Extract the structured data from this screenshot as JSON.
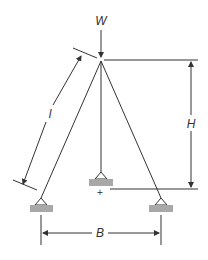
{
  "diagram": {
    "type": "structural-tripod-frame",
    "labels": {
      "load": "W",
      "leg_length": "l",
      "height": "H",
      "base_width": "B",
      "origin_mark": "+"
    },
    "colors": {
      "line": "#333333",
      "support_fill": "#a8a8a8"
    }
  }
}
